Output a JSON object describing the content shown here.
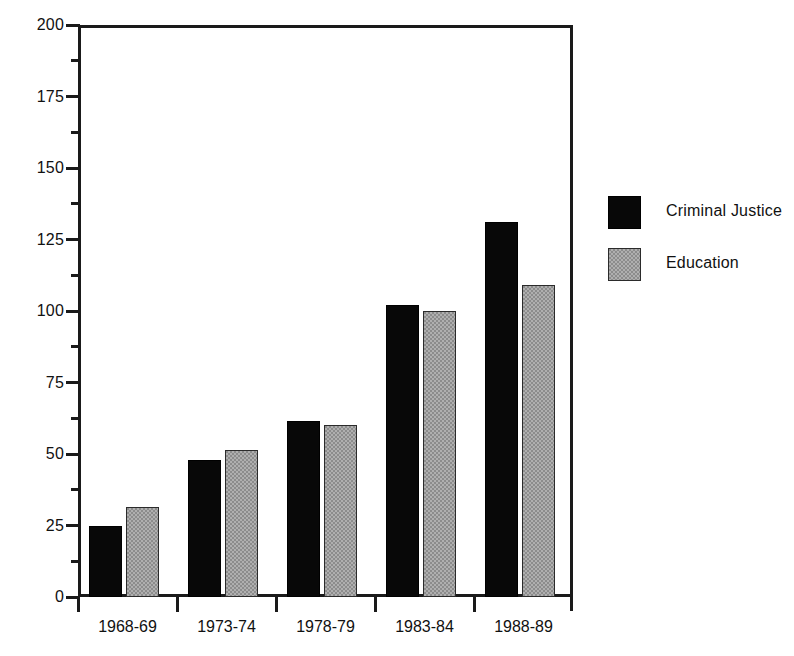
{
  "chart_data": {
    "type": "bar",
    "title": "",
    "subtitle": "",
    "xlabel": "",
    "ylabel": "",
    "categories": [
      "1968-69",
      "1973-74",
      "1978-79",
      "1983-84",
      "1988-89"
    ],
    "series": [
      {
        "name": "Criminal Justice",
        "color": "#080808",
        "values": [
          25,
          48,
          61.5,
          102,
          131
        ]
      },
      {
        "name": "Education",
        "color": "#8c8c8c",
        "values": [
          31.5,
          51.5,
          60,
          100,
          109
        ]
      }
    ],
    "ylim": [
      0,
      200
    ],
    "y_major_ticks": [
      0,
      25,
      50,
      75,
      100,
      125,
      150,
      175,
      200
    ],
    "y_minor_ticks": [
      12.5,
      37.5,
      62.5,
      87.5,
      112.5,
      137.5,
      162.5,
      187.5
    ],
    "y_tick_labels": [
      "0",
      "25",
      "50",
      "75",
      "100",
      "125",
      "150",
      "175",
      "200"
    ],
    "grid": false,
    "legend_position": "right",
    "legend_entries": [
      "Criminal Justice",
      "Education"
    ],
    "annotations": []
  }
}
